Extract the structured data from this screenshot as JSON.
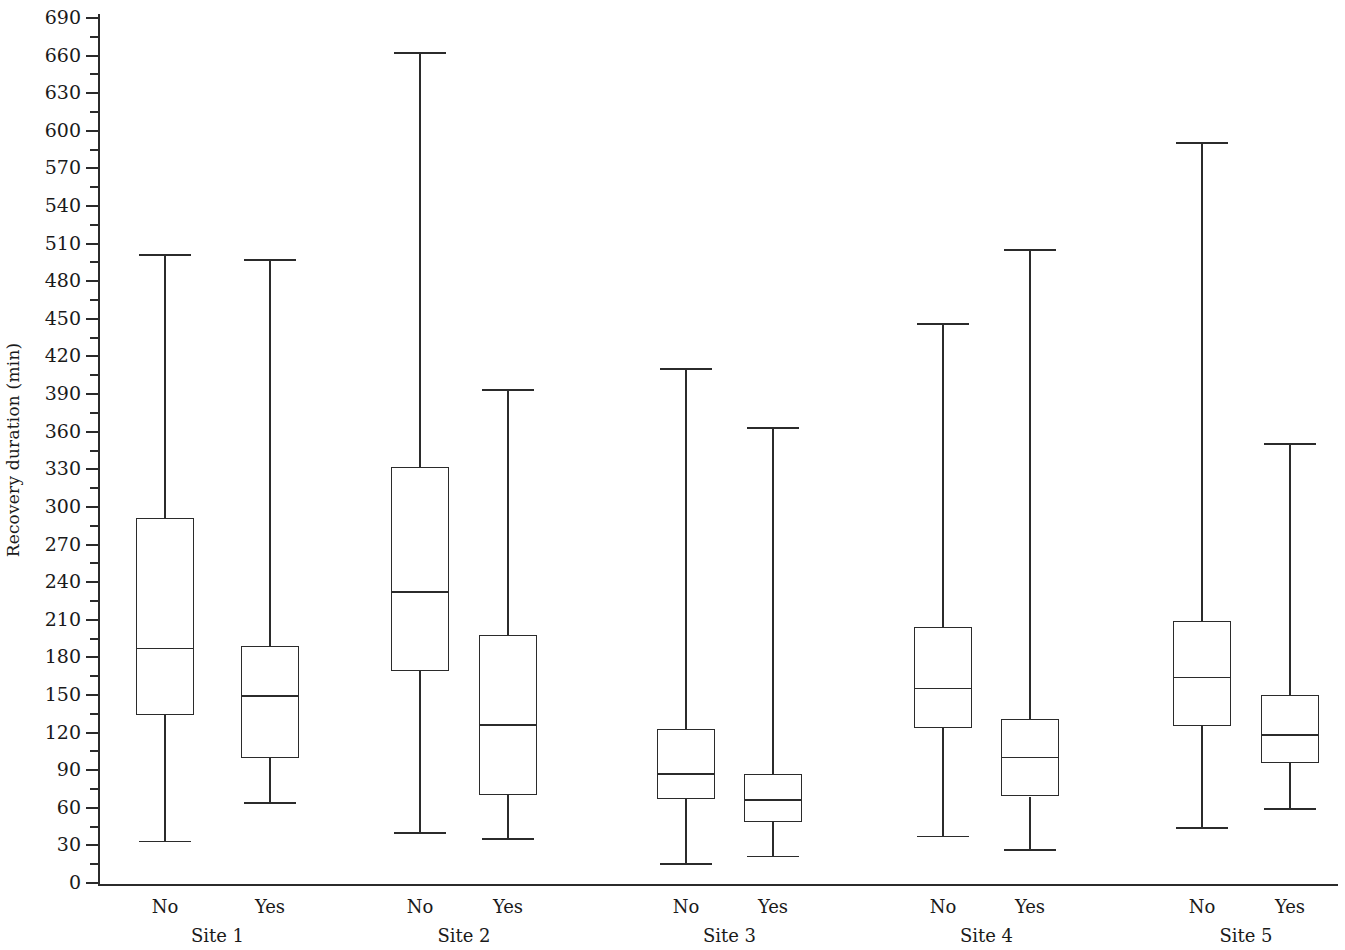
{
  "chart_data": {
    "type": "box",
    "title": "",
    "xlabel": "",
    "ylabel": "Recovery duration (min)",
    "ylim": [
      0,
      690
    ],
    "ytick_step": 30,
    "yticks": [
      0,
      30,
      60,
      90,
      120,
      150,
      180,
      210,
      240,
      270,
      300,
      330,
      360,
      390,
      420,
      450,
      480,
      510,
      540,
      570,
      600,
      630,
      660,
      690
    ],
    "ytick_labels": [
      "0",
      "30",
      "60",
      "90",
      "120",
      "150",
      "180",
      "210",
      "240",
      "270",
      "300",
      "330",
      "360",
      "390",
      "420",
      "450",
      "480",
      "510",
      "540",
      "570",
      "600",
      "630",
      "660",
      "690"
    ],
    "minor_ticks": true,
    "grid": false,
    "legend": null,
    "groups": [
      "Site 1",
      "Site 2",
      "Site 3",
      "Site 4",
      "Site 5"
    ],
    "categories": [
      "No",
      "Yes"
    ],
    "boxes": [
      {
        "group": "Site 1",
        "category": "No",
        "whisker_low": 33,
        "q1": 134,
        "median": 187,
        "q3": 291,
        "whisker_high": 501
      },
      {
        "group": "Site 1",
        "category": "Yes",
        "whisker_low": 64,
        "q1": 100,
        "median": 149,
        "q3": 189,
        "whisker_high": 497
      },
      {
        "group": "Site 2",
        "category": "No",
        "whisker_low": 40,
        "q1": 169,
        "median": 232,
        "q3": 332,
        "whisker_high": 662
      },
      {
        "group": "Site 2",
        "category": "Yes",
        "whisker_low": 35,
        "q1": 70,
        "median": 126,
        "q3": 198,
        "whisker_high": 393
      },
      {
        "group": "Site 3",
        "category": "No",
        "whisker_low": 15,
        "q1": 67,
        "median": 87,
        "q3": 123,
        "whisker_high": 410
      },
      {
        "group": "Site 3",
        "category": "Yes",
        "whisker_low": 21,
        "q1": 49,
        "median": 66,
        "q3": 87,
        "whisker_high": 363
      },
      {
        "group": "Site 4",
        "category": "No",
        "whisker_low": 37,
        "q1": 124,
        "median": 155,
        "q3": 204,
        "whisker_high": 446
      },
      {
        "group": "Site 4",
        "category": "Yes",
        "whisker_low": 26,
        "q1": 69,
        "median": 100,
        "q3": 131,
        "whisker_high": 505
      },
      {
        "group": "Site 5",
        "category": "No",
        "whisker_low": 44,
        "q1": 125,
        "median": 164,
        "q3": 209,
        "whisker_high": 590
      },
      {
        "group": "Site 5",
        "category": "Yes",
        "whisker_low": 59,
        "q1": 96,
        "median": 118,
        "q3": 150,
        "whisker_high": 350
      }
    ],
    "colors": {
      "line": "#2b2b2b",
      "box_fill": "#ffffff",
      "background": "#ffffff"
    }
  },
  "axis": {
    "y_title": "Recovery duration (min)"
  }
}
